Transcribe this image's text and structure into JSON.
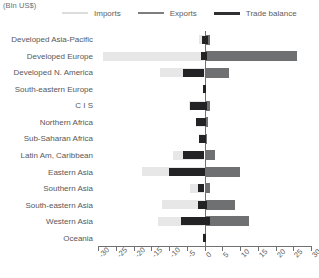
{
  "caption": "(Bln US$)",
  "legend": {
    "position": "top",
    "entries": [
      {
        "label": "Imports",
        "color": "#dcdcdc",
        "icon": "line-swatch-icon"
      },
      {
        "label": "Exports",
        "color": "#7d7e80",
        "icon": "line-swatch-icon"
      },
      {
        "label": "Trade balance",
        "color": "#2f2f31",
        "icon": "line-swatch-icon"
      }
    ]
  },
  "axis": {
    "ticks": [
      "-30",
      "-25",
      "-20",
      "-15",
      "-10",
      "-5",
      "0",
      "5",
      "10",
      "15",
      "20",
      "25",
      "30"
    ],
    "min": -30,
    "max": 30,
    "step": 5
  },
  "chart_data": {
    "type": "bar",
    "orientation": "horizontal",
    "title": "",
    "subtitle": "",
    "xlabel": "(Bln US$)",
    "ylabel": "",
    "xlim": [
      -30,
      30
    ],
    "xticks": [
      -30,
      -25,
      -20,
      -15,
      -10,
      -5,
      0,
      5,
      10,
      15,
      20,
      25,
      30
    ],
    "grid": false,
    "legend_position": "top",
    "categories": [
      "Developed Asia-Pacific",
      "Developed Europe",
      "Developed N. America",
      "South-eastern Europe",
      "C I S",
      "Northern Africa",
      "Sub-Saharan Africa",
      "Latin Am, Caribbean",
      "Eastern Asia",
      "Southern Asia",
      "South-eastern Asia",
      "Western Asia",
      "Oceania"
    ],
    "series": [
      {
        "name": "Imports",
        "color": "#e7e7e7",
        "values": [
          -1.5,
          -28.5,
          -12.5,
          -0.5,
          -4.5,
          -2.5,
          -1.5,
          -9,
          -17.5,
          -4,
          -12,
          -13,
          -0.3
        ]
      },
      {
        "name": "Exports",
        "color": "#6f7072",
        "values": [
          1.5,
          26,
          7,
          0.5,
          1.5,
          1.0,
          0.8,
          3,
          10,
          1.5,
          8.5,
          12.5,
          0.3
        ]
      },
      {
        "name": "Trade balance",
        "color": "#232325",
        "values": [
          {
            "from": -0.8,
            "to": 1.0
          },
          {
            "from": -1.0,
            "to": 0.8
          },
          {
            "from": -6.0,
            "to": 0.0
          },
          {
            "from": -0.5,
            "to": 0.5
          },
          {
            "from": -4.0,
            "to": 0.8
          },
          {
            "from": -2.3,
            "to": 0.5
          },
          {
            "from": -1.5,
            "to": 0.5
          },
          {
            "from": -6.0,
            "to": 0.0
          },
          {
            "from": -10.0,
            "to": 0.0
          },
          {
            "from": -1.8,
            "to": 0.0
          },
          {
            "from": -1.8,
            "to": 0.8
          },
          {
            "from": -6.5,
            "to": 1.5
          },
          {
            "from": -0.3,
            "to": 0.3
          }
        ]
      }
    ]
  }
}
